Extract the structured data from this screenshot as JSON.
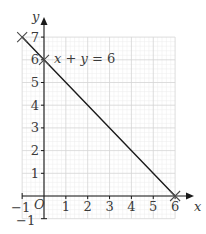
{
  "chart_data": {
    "type": "line",
    "title": "",
    "xlabel": "x",
    "ylabel": "y",
    "xlim": [
      -1,
      6
    ],
    "ylim": [
      -1,
      7
    ],
    "grid": true,
    "origin_label": "O",
    "x_ticks": [
      "1",
      "2",
      "3",
      "4",
      "5",
      "6"
    ],
    "y_ticks": [
      "1",
      "2",
      "3",
      "4",
      "5",
      "6",
      "7"
    ],
    "x_neg_label": "−1",
    "y_neg_label": "−1",
    "series": [
      {
        "name": "x + y = 6",
        "x": [
          -1,
          0,
          6
        ],
        "y": [
          7,
          6,
          0
        ]
      }
    ],
    "annotations": [
      {
        "text": "x + y = 6",
        "x": 0.3,
        "y": 6.5
      },
      {
        "marker": "cross",
        "x": -1,
        "y": 7
      },
      {
        "marker": "cross",
        "x": 0,
        "y": 6
      },
      {
        "marker": "cross",
        "x": 6,
        "y": 0
      }
    ],
    "colors": {
      "line": "#1a1a1a",
      "axis": "#1a1a1a",
      "grid_major": "#d4d4d4",
      "grid_minor": "#ececec",
      "text": "#3a3a3a"
    }
  }
}
